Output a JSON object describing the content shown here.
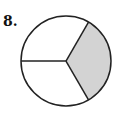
{
  "problem": {
    "number": "8."
  },
  "figure": {
    "type": "fraction-circle",
    "parts": 3,
    "shaded_parts": 1,
    "shade_color": "#d3d3d3",
    "stroke_color": "#222222",
    "center": [
      66,
      61
    ],
    "radius": 45
  },
  "chart_data": {
    "type": "pie",
    "categories": [
      "shaded",
      "unshaded",
      "unshaded"
    ],
    "values": [
      1,
      1,
      1
    ],
    "title": "8.",
    "colors": [
      "#d3d3d3",
      "#ffffff",
      "#ffffff"
    ]
  }
}
